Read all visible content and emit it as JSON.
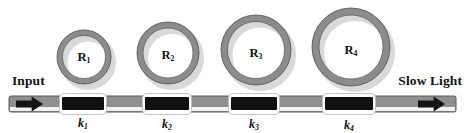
{
  "figure": {
    "width": 471,
    "height": 133,
    "background": "#ffffff"
  },
  "colors": {
    "ring_body": "#8c8c8c",
    "ring_outline": "#4a4a4a",
    "ring_shadow": "#d9d9d9",
    "waveguide": "#8f8f8f",
    "waveguide_outline": "#5a5a5a",
    "coupler_fill": "#111111",
    "coupler_border": "#ffffff",
    "arrow": "#141414",
    "text": "#111111"
  },
  "ports": {
    "input": {
      "label": "Input",
      "label_x": 12,
      "label_y": 81,
      "arrow_x": 16,
      "arrow_y": 104,
      "arrow_w": 27,
      "arrow_dir": "right"
    },
    "output": {
      "label": "Slow Light",
      "label_x": 462,
      "label_y": 81,
      "arrow_x": 418,
      "arrow_y": 104,
      "arrow_w": 27,
      "arrow_dir": "right"
    }
  },
  "waveguide": {
    "name": "bus-waveguide",
    "x": 9,
    "y": 96,
    "width": 447,
    "height": 16
  },
  "rings": [
    {
      "id": "R1",
      "label": "R",
      "subscript": "1",
      "cx": 84,
      "cy": 57,
      "outer_r": 27,
      "band": 5.5,
      "label_x": 84,
      "label_y": 58
    },
    {
      "id": "R2",
      "label": "R",
      "subscript": "2",
      "cx": 168,
      "cy": 53,
      "outer_r": 31,
      "band": 6,
      "label_x": 168,
      "label_y": 56
    },
    {
      "id": "R3",
      "label": "R",
      "subscript": "3",
      "cx": 256,
      "cy": 50,
      "outer_r": 35,
      "band": 6.5,
      "label_x": 256,
      "label_y": 54
    },
    {
      "id": "R4",
      "label": "R",
      "subscript": "4",
      "cx": 351,
      "cy": 47,
      "outer_r": 39,
      "band": 7,
      "label_x": 351,
      "label_y": 51
    }
  ],
  "couplers": [
    {
      "id": "k1",
      "label": "k",
      "subscript": "1",
      "x": 62,
      "y": 96,
      "width": 42,
      "height": 16,
      "label_x": 83,
      "label_y": 117
    },
    {
      "id": "k2",
      "label": "k",
      "subscript": "2",
      "x": 145,
      "y": 96,
      "width": 44,
      "height": 16,
      "label_x": 167,
      "label_y": 118
    },
    {
      "id": "k3",
      "label": "k",
      "subscript": "3",
      "x": 231,
      "y": 96,
      "width": 46,
      "height": 16,
      "label_x": 254,
      "label_y": 118
    },
    {
      "id": "k4",
      "label": "k",
      "subscript": "4",
      "x": 325,
      "y": 96,
      "width": 48,
      "height": 16,
      "label_x": 349,
      "label_y": 119
    }
  ]
}
